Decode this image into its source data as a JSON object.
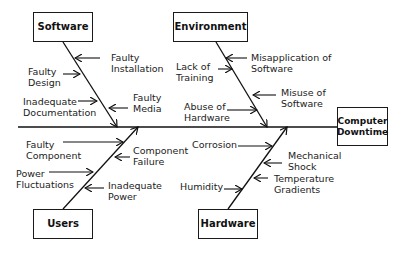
{
  "diagram": {
    "type": "fishbone",
    "effect": "Computer\nDowntime",
    "categories": {
      "software": "Software",
      "environment": "Environment",
      "users": "Users",
      "hardware": "Hardware"
    },
    "causes": {
      "software": [
        "Faulty\nInstallation",
        "Faulty\nDesign",
        "Inadequate\nDocumentation",
        "Faulty\nMedia"
      ],
      "environment": [
        "Misapplication of\nSoftware",
        "Lack of\nTraining",
        "Misuse of\nSoftware",
        "Abuse of\nHardware"
      ],
      "users": [
        "Faulty\nComponent",
        "Component\nFailure",
        "Power\nFluctuations",
        "Inadequate\nPower"
      ],
      "hardware": [
        "Corrosion",
        "Mechanical\nShock",
        "Temperature\nGradients",
        "Humidity"
      ]
    },
    "colors": {
      "line": "#111111",
      "text": "#222222",
      "background": "#ffffff"
    }
  }
}
